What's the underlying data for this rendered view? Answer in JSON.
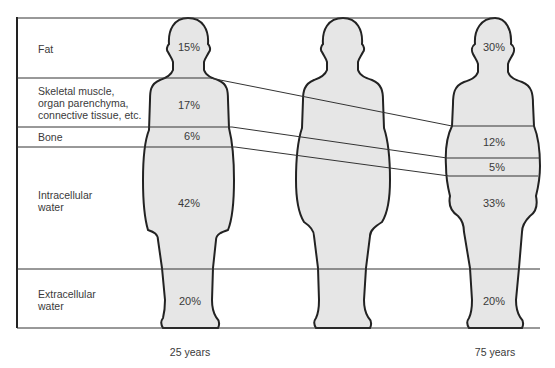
{
  "diagram": {
    "type": "body-composition-comparison",
    "fill_color": "#e6e6e6",
    "line_color": "#222222",
    "compartments": [
      {
        "label": "Fat",
        "young": "15%",
        "old": "30%"
      },
      {
        "label": "Skeletal muscle,\norgan parenchyma,\nconnective tissue, etc.",
        "young": "17%",
        "old": "12%"
      },
      {
        "label": "Bone",
        "young": "6%",
        "old": "5%"
      },
      {
        "label": "Intracellular\nwater",
        "young": "42%",
        "old": "33%"
      },
      {
        "label": "Extracellular\nwater",
        "young": "20%",
        "old": "20%"
      }
    ],
    "labels": {
      "fat": "Fat",
      "muscle_1": "Skeletal muscle,",
      "muscle_2": "organ parenchyma,",
      "muscle_3": "connective tissue, etc.",
      "bone": "Bone",
      "icw_1": "Intracellular",
      "icw_2": "water",
      "ecw_1": "Extracellular",
      "ecw_2": "water"
    },
    "young": {
      "age_label": "25 years",
      "fat": "15%",
      "muscle": "17%",
      "bone": "6%",
      "icw": "42%",
      "ecw": "20%"
    },
    "old": {
      "age_label": "75 years",
      "fat": "30%",
      "muscle": "12%",
      "bone": "5%",
      "icw": "33%",
      "ecw": "20%"
    }
  }
}
